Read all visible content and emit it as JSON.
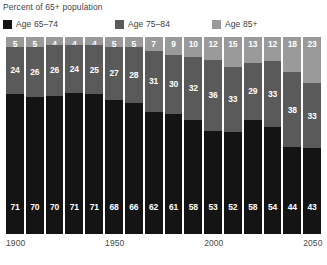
{
  "chart_data": {
    "type": "bar",
    "subtype": "stacked-percentage-column",
    "title": "Percent of 65+ population",
    "xlabel": "",
    "ylabel": "",
    "ylim": [
      0,
      100
    ],
    "grid": false,
    "legend_position": "top",
    "categories": [
      "1900",
      "1910",
      "1920",
      "1930",
      "1940",
      "1950",
      "1960",
      "1970",
      "1980",
      "1990",
      "2000",
      "2010",
      "2020",
      "2030",
      "2040",
      "2050"
    ],
    "axis_ticks": [
      {
        "label": "1900",
        "index": 0
      },
      {
        "label": "1950",
        "index": 5
      },
      {
        "label": "2000",
        "index": 10
      },
      {
        "label": "2050",
        "index": 15
      }
    ],
    "series": [
      {
        "name": "Age 65–74",
        "color": "#141414",
        "values": [
          71,
          70,
          70,
          71,
          71,
          68,
          66,
          62,
          61,
          58,
          53,
          52,
          58,
          54,
          44,
          43
        ]
      },
      {
        "name": "Age 75–84",
        "color": "#5a5a5a",
        "values": [
          24,
          26,
          26,
          24,
          25,
          27,
          28,
          31,
          30,
          32,
          36,
          33,
          29,
          33,
          38,
          33
        ]
      },
      {
        "name": "Age 85+",
        "color": "#9a9a9a",
        "values": [
          5,
          5,
          4,
          4,
          4,
          5,
          5,
          7,
          9,
          10,
          12,
          15,
          13,
          12,
          18,
          23
        ]
      }
    ]
  }
}
